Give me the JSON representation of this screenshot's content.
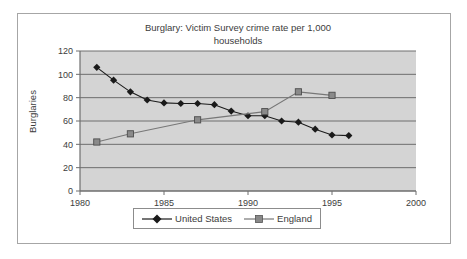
{
  "chart_data": {
    "type": "line",
    "title": "Burglary: Victim Survey crime rate per 1,000 households",
    "xlabel": "",
    "ylabel": "Burglaries",
    "xlim": [
      1980,
      2000
    ],
    "ylim": [
      0,
      120
    ],
    "y_ticks": [
      0,
      20,
      40,
      60,
      80,
      100,
      120
    ],
    "x_ticks": [
      1980,
      1985,
      1990,
      1995,
      2000
    ],
    "x_tick_labels": [
      "1980",
      "1985",
      "1990",
      "1995",
      "2000"
    ],
    "y_tick_labels": [
      "0",
      "20",
      "40",
      "60",
      "80",
      "100",
      "120"
    ],
    "grid": "horizontal",
    "legend_position": "bottom",
    "plot_background": "#d4d4d4",
    "series": [
      {
        "name": "United States",
        "color": "#1a1a1a",
        "marker": "diamond",
        "x": [
          1981,
          1982,
          1983,
          1984,
          1985,
          1986,
          1987,
          1988,
          1989,
          1990,
          1991,
          1992,
          1993,
          1994,
          1995,
          1996
        ],
        "values": [
          106,
          95,
          85,
          78,
          75.5,
          75,
          75,
          74,
          68.5,
          64.5,
          64.5,
          60,
          59,
          53,
          48,
          47.5
        ]
      },
      {
        "name": "England",
        "color": "#777777",
        "marker": "square",
        "x": [
          1981,
          1983,
          1987,
          1991,
          1993,
          1995
        ],
        "values": [
          42,
          49,
          61,
          68,
          85,
          82
        ]
      }
    ]
  },
  "figure": {
    "title": "Burglary: Victim Survey crime rate per 1,000 households",
    "title_line1": "Burglary: Victim Survey crime rate per 1,000",
    "title_line2": "households",
    "y_axis_title": "Burglaries"
  },
  "legend": {
    "items": [
      {
        "label": "United States",
        "color": "#1a1a1a",
        "marker": "diamond"
      },
      {
        "label": "England",
        "color": "#777777",
        "marker": "square"
      }
    ]
  }
}
